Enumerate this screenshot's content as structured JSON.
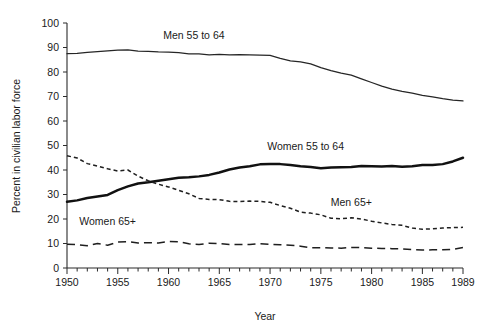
{
  "chart_data": {
    "type": "line",
    "title": "",
    "xlabel": "Year",
    "ylabel": "Percent in civilian labor force",
    "xlim": [
      1950,
      1989
    ],
    "ylim": [
      0,
      100
    ],
    "grid": false,
    "legend_position": "inline-labels",
    "x_tick_labels": [
      "1950",
      "1955",
      "1960",
      "1965",
      "1970",
      "1975",
      "1980",
      "1985",
      "1989"
    ],
    "x_tick_values": [
      1950,
      1955,
      1960,
      1965,
      1970,
      1975,
      1980,
      1985,
      1989
    ],
    "x_minor_tick_step": 1,
    "y_tick_labels": [
      "0",
      "10",
      "20",
      "30",
      "40",
      "50",
      "60",
      "70",
      "80",
      "90",
      "100"
    ],
    "y_tick_values": [
      0,
      10,
      20,
      30,
      40,
      50,
      60,
      70,
      80,
      90,
      100
    ],
    "x": [
      1950,
      1951,
      1952,
      1953,
      1954,
      1955,
      1956,
      1957,
      1958,
      1959,
      1960,
      1961,
      1962,
      1963,
      1964,
      1965,
      1966,
      1967,
      1968,
      1969,
      1970,
      1971,
      1972,
      1973,
      1974,
      1975,
      1976,
      1977,
      1978,
      1979,
      1980,
      1981,
      1982,
      1983,
      1984,
      1985,
      1986,
      1987,
      1988,
      1989
    ],
    "series": [
      {
        "name": "Men 55 to 64",
        "style": "solid-thin",
        "label_x": 1962.5,
        "label_y": 93.5,
        "values": [
          87.5,
          87.6,
          88.0,
          88.3,
          88.6,
          88.9,
          89.0,
          88.5,
          88.4,
          88.2,
          88.1,
          87.9,
          87.4,
          87.4,
          87.0,
          87.2,
          87.0,
          87.1,
          87.0,
          86.9,
          86.8,
          85.6,
          84.5,
          84.1,
          83.3,
          81.8,
          80.6,
          79.5,
          78.7,
          77.2,
          75.7,
          74.2,
          73.0,
          72.1,
          71.4,
          70.5,
          69.8,
          69.1,
          68.5,
          68.2
        ]
      },
      {
        "name": "Women 55 to 64",
        "style": "solid-thick",
        "label_x": 1973.5,
        "label_y": 48.0,
        "values": [
          27.0,
          27.6,
          28.6,
          29.2,
          29.8,
          31.8,
          33.3,
          34.5,
          35.0,
          35.6,
          36.2,
          36.8,
          37.0,
          37.4,
          38.0,
          39.0,
          40.2,
          41.0,
          41.5,
          42.3,
          42.5,
          42.4,
          42.0,
          41.5,
          41.2,
          40.7,
          41.0,
          41.1,
          41.2,
          41.6,
          41.5,
          41.4,
          41.6,
          41.3,
          41.5,
          42.0,
          42.0,
          42.4,
          43.5,
          45.0
        ]
      },
      {
        "name": "Men 65+",
        "style": "dotted",
        "label_x": 1978.0,
        "label_y": 25.5,
        "values": [
          45.8,
          44.9,
          42.6,
          41.6,
          40.5,
          39.6,
          40.0,
          37.5,
          35.6,
          34.2,
          33.1,
          31.7,
          30.3,
          28.4,
          28.0,
          27.9,
          27.2,
          27.1,
          27.3,
          27.2,
          26.8,
          25.5,
          24.4,
          22.8,
          22.4,
          21.7,
          20.3,
          20.1,
          20.5,
          20.0,
          19.1,
          18.4,
          17.8,
          17.4,
          16.3,
          15.8,
          16.0,
          16.3,
          16.5,
          16.6
        ]
      },
      {
        "name": "Women 65+",
        "style": "dashed",
        "label_x": 1954.0,
        "label_y": 17.5,
        "values": [
          9.7,
          9.5,
          9.1,
          10.0,
          9.3,
          10.6,
          10.8,
          10.2,
          10.3,
          10.2,
          10.8,
          10.7,
          9.9,
          9.6,
          10.1,
          10.0,
          9.6,
          9.6,
          9.6,
          9.9,
          9.7,
          9.5,
          9.3,
          8.9,
          8.2,
          8.3,
          8.2,
          8.1,
          8.4,
          8.3,
          8.1,
          8.0,
          7.9,
          7.8,
          7.5,
          7.3,
          7.4,
          7.4,
          7.6,
          8.4
        ]
      }
    ]
  },
  "colors": {
    "axis": "#2b2b2b",
    "text": "#1a1a1a",
    "background": "#ffffff"
  }
}
